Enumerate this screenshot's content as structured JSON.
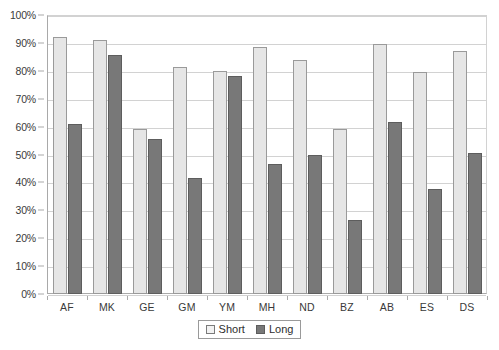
{
  "chart_data": {
    "type": "bar",
    "title": "",
    "subtitle": "",
    "xlabel": "",
    "ylabel": "",
    "categories": [
      "AF",
      "MK",
      "GE",
      "GM",
      "YM",
      "MH",
      "ND",
      "BZ",
      "AB",
      "ES",
      "DS"
    ],
    "series": [
      {
        "name": "Short",
        "color": "#e6e6e6",
        "values": [
          92,
          91,
          59,
          81.5,
          80,
          88.5,
          84,
          59,
          89.5,
          79.5,
          87
        ]
      },
      {
        "name": "Long",
        "color": "#787878",
        "values": [
          61,
          85.5,
          55.5,
          41.5,
          78,
          46.5,
          50,
          26.5,
          61.5,
          37.5,
          50.5
        ]
      }
    ],
    "ylim": [
      0,
      100
    ],
    "y_tick_values": [
      0,
      10,
      20,
      30,
      40,
      50,
      60,
      70,
      80,
      90,
      100
    ],
    "y_tick_labels": [
      "0%",
      "10%",
      "20%",
      "30%",
      "40%",
      "50%",
      "60%",
      "70%",
      "80%",
      "90%",
      "100%"
    ],
    "y_unit": "%",
    "grid": "horizontal",
    "legend_position": "bottom-center"
  },
  "legend": {
    "entries": [
      {
        "label": "Short",
        "swatch": "legend-swatch-short"
      },
      {
        "label": "Long",
        "swatch": "legend-swatch-long"
      }
    ]
  },
  "colors": {
    "short_fill": "#e6e6e6",
    "short_border": "#9a9a9a",
    "long_fill": "#787878",
    "long_border": "#5d5d5d",
    "gridline": "#d2d2d2",
    "axis": "#a9a9a9",
    "text": "#3a3a3a",
    "background": "#ffffff"
  }
}
